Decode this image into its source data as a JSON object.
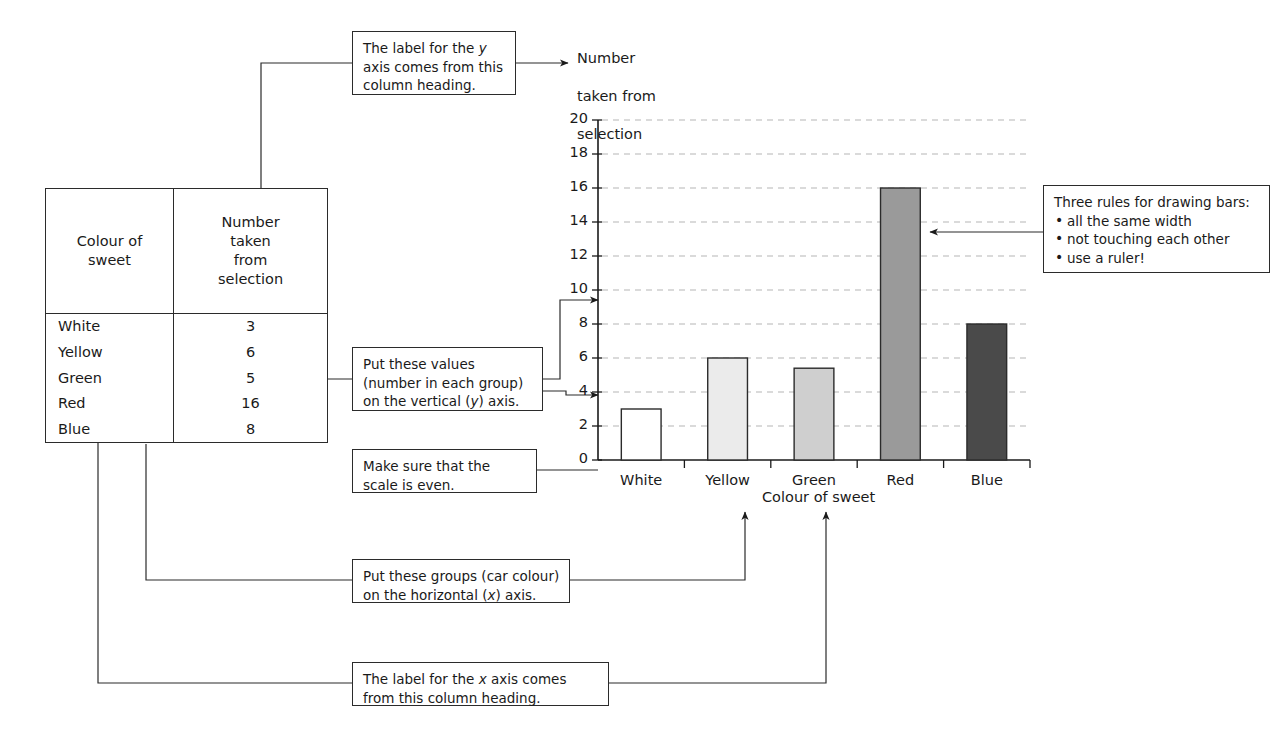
{
  "table": {
    "headers": [
      "Colour of sweet",
      "Number taken from selection"
    ],
    "header_lines": [
      [
        "Colour of",
        "sweet"
      ],
      [
        "Number",
        "taken",
        "from",
        "selection"
      ]
    ],
    "rows": [
      {
        "colour": "White",
        "count": "3"
      },
      {
        "colour": "Yellow",
        "count": "6"
      },
      {
        "colour": "Green",
        "count": "5"
      },
      {
        "colour": "Red",
        "count": "16"
      },
      {
        "colour": "Blue",
        "count": "8"
      }
    ]
  },
  "callouts": {
    "y_label": {
      "lines": [
        "The label for the y",
        "axis comes from this",
        "column heading."
      ],
      "italic_token": "y"
    },
    "values": {
      "lines": [
        "Put these values",
        "(number in each group)",
        "on the vertical (y) axis."
      ],
      "italic_token": "y"
    },
    "scale": {
      "lines": [
        "Make sure that the",
        "scale is even."
      ]
    },
    "groups": {
      "lines": [
        "Put these groups (car colour)",
        "on the horizontal (x) axis."
      ],
      "italic_token": "x"
    },
    "x_label": {
      "lines": [
        "The label for the x axis comes",
        "from this column heading."
      ],
      "italic_token": "x"
    },
    "rules": {
      "title": "Three rules for drawing bars:",
      "items": [
        "all the same width",
        "not touching each other",
        "use a ruler!"
      ]
    }
  },
  "chart_data": {
    "type": "bar",
    "title": "",
    "categories": [
      "White",
      "Yellow",
      "Green",
      "Red",
      "Blue"
    ],
    "values": [
      3,
      6,
      5.4,
      16,
      8
    ],
    "table_values": [
      3,
      6,
      5,
      16,
      8
    ],
    "xlabel": "Colour of sweet",
    "ylabel": "Number taken from selection",
    "ylim": [
      0,
      20
    ],
    "ytick_step": 2,
    "yticks": [
      0,
      2,
      4,
      6,
      8,
      10,
      12,
      14,
      16,
      18,
      20
    ],
    "grid": true,
    "grid_style": "dashed-horizontal",
    "legend": "none",
    "bar_fills": [
      "#ffffff",
      "#ebebeb",
      "#cfcfcf",
      "#9a9a9a",
      "#4a4a4a"
    ],
    "bar_edge": "#2b2b2b"
  },
  "colors": {
    "ink": "#1a1a1a",
    "line": "#2b2b2b",
    "grid": "#b5b5b5",
    "background": "#ffffff"
  }
}
